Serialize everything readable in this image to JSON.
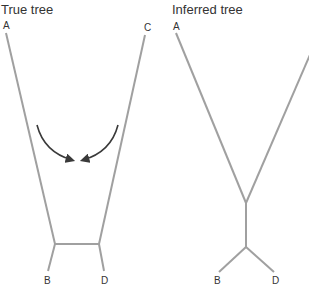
{
  "true_tree": {
    "title": "True tree",
    "labels": {
      "a": "A",
      "b": "B",
      "c": "C",
      "d": "D"
    }
  },
  "inferred_tree": {
    "title": "Inferred tree",
    "labels": {
      "a": "A",
      "b": "B",
      "d": "D"
    }
  },
  "colors": {
    "branch": "#a0a0a0",
    "arrow": "#3a3a3a",
    "text": "#333333"
  }
}
